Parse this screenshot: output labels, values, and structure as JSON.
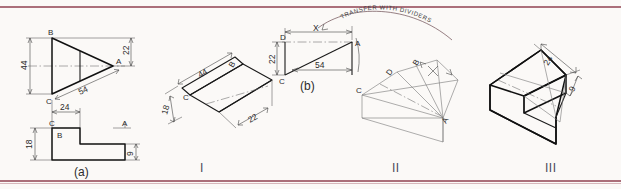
{
  "document": {
    "kind": "engineering-drawing-scan",
    "description": "Isometric projection construction: orthographic views and three construction steps"
  },
  "colors": {
    "rule": "#9c5764",
    "ink": "#111111",
    "construction": "#777777",
    "paper": "#fbf9f7"
  },
  "panels": {
    "a": {
      "caption": "(a)",
      "top_view": {
        "points": [
          "B",
          "C",
          "A"
        ],
        "dimensions": [
          "44",
          "22",
          "54"
        ]
      },
      "front_view": {
        "points": [
          "C",
          "B",
          "A"
        ],
        "dimensions": [
          "24",
          "18",
          "9"
        ]
      }
    },
    "b": {
      "caption": "(b)",
      "points": [
        "D",
        "A",
        "C"
      ],
      "dimensions": [
        "X",
        "22",
        "54"
      ],
      "note": "TRANSFER  WITH  DIVIDERS"
    }
  },
  "steps": [
    {
      "numeral": "I",
      "points": [
        "C",
        "B"
      ],
      "dimensions": [
        "44",
        "18",
        "22"
      ]
    },
    {
      "numeral": "II",
      "points": [
        "C",
        "D",
        "B",
        "A"
      ],
      "dimensions": []
    },
    {
      "numeral": "III",
      "points": [],
      "dimensions": [
        "24",
        "9"
      ]
    }
  ]
}
